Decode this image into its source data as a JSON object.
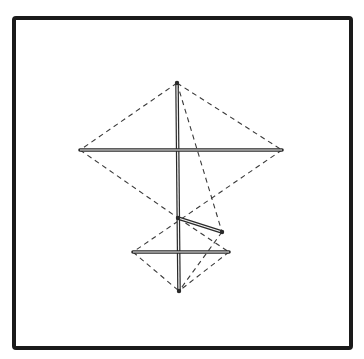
{
  "diagram": {
    "type": "kite-structure-line-drawing",
    "frame": {
      "x": 14,
      "y": 18,
      "width": 337,
      "height": 330,
      "stroke": "#1a1a1a",
      "stroke_width": 4
    },
    "colors": {
      "background": "#ffffff",
      "rod": "#2a2a2a",
      "dash": "#3a3a3a"
    },
    "points": {
      "top_apex": [
        177,
        83
      ],
      "upper_left": [
        80,
        150
      ],
      "upper_right": [
        282,
        150
      ],
      "junction": [
        178,
        218
      ],
      "tilt_end": [
        222,
        232
      ],
      "lower_left": [
        133,
        252
      ],
      "lower_right": [
        229,
        252
      ],
      "bottom_apex": [
        179,
        291
      ]
    },
    "rods": [
      {
        "name": "vertical-spine",
        "from": "top_apex",
        "to": "bottom_apex"
      },
      {
        "name": "upper-crossbar",
        "from": "upper_left",
        "to": "upper_right"
      },
      {
        "name": "lower-crossbar",
        "from": "lower_left",
        "to": "lower_right"
      },
      {
        "name": "tilted-strut",
        "from": "junction",
        "to": "tilt_end"
      }
    ],
    "dashed_lines": [
      {
        "from": "top_apex",
        "to": "upper_left"
      },
      {
        "from": "top_apex",
        "to": "upper_right"
      },
      {
        "from": "upper_left",
        "to": "junction"
      },
      {
        "from": "upper_right",
        "to": "lower_left"
      },
      {
        "from": "top_apex",
        "to": "tilt_end"
      },
      {
        "from": "junction",
        "to": "lower_right"
      },
      {
        "from": "lower_left",
        "to": "bottom_apex"
      },
      {
        "from": "lower_right",
        "to": "bottom_apex"
      },
      {
        "from": "tilt_end",
        "to": "bottom_apex"
      }
    ]
  }
}
